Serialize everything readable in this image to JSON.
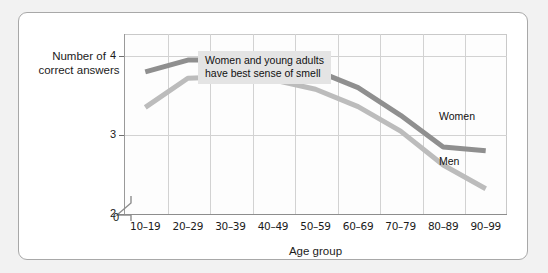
{
  "chart_data": {
    "type": "line",
    "title": "",
    "xlabel": "Age group",
    "ylabel": "Number of correct answers",
    "categories": [
      "10–19",
      "20–29",
      "30–39",
      "40–49",
      "50–59",
      "60–69",
      "70–79",
      "80–89",
      "90–99"
    ],
    "series": [
      {
        "name": "Women",
        "color": "#8f8f8f",
        "values": [
          3.8,
          3.95,
          3.95,
          3.93,
          3.82,
          3.6,
          3.25,
          2.85,
          2.8
        ]
      },
      {
        "name": "Men",
        "color": "#bcbcbc",
        "values": [
          3.35,
          3.72,
          3.74,
          3.7,
          3.58,
          3.36,
          3.05,
          2.62,
          2.32
        ]
      }
    ],
    "yticks": [
      "0",
      "2",
      "3",
      "4"
    ],
    "ylim": [
      2,
      4.28
    ],
    "grid": true,
    "axis_break": true,
    "legend_position": "inline-right",
    "annotations": [
      {
        "text_line_1": "Women and young adults",
        "text_line_2": "have best sense of smell"
      }
    ]
  },
  "axis": {
    "y_title_line_1": "Number of",
    "y_title_line_2": "correct answers",
    "x_title": "Age group",
    "zero_label": "0"
  }
}
